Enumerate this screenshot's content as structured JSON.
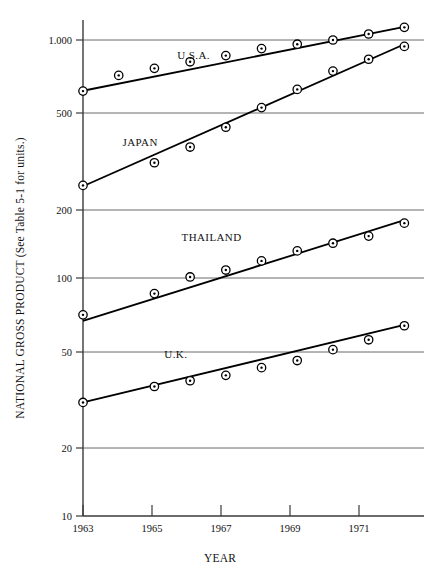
{
  "chart_data": {
    "type": "line",
    "title": "",
    "xlabel": "YEAR",
    "ylabel": "NATIONAL GROSS PRODUCT (See Table 5-1 for units.)",
    "yscale": "log",
    "ylim": [
      10,
      1300
    ],
    "xlim": [
      1963,
      1972
    ],
    "grid": true,
    "legend_position": "inline-labels",
    "y_tick_labels": [
      "1.000",
      "500",
      "200",
      "100",
      "50",
      "20",
      "10"
    ],
    "y_tick_values": [
      1000,
      500,
      200,
      100,
      50,
      20,
      10
    ],
    "x_tick_labels": [
      "1963",
      "1965",
      "1967",
      "1969",
      "1971"
    ],
    "x_tick_values": [
      1963,
      1965,
      1967,
      1969,
      1971
    ],
    "x": [
      1963,
      1964,
      1965,
      1966,
      1967,
      1968,
      1969,
      1970,
      1971,
      1972
    ],
    "series": [
      {
        "name": "U.S.A.",
        "label": "U.S.A.",
        "label_x": 1966.1,
        "label_y": 830,
        "values": [
          610,
          710,
          760,
          810,
          860,
          920,
          960,
          1000,
          1060,
          1130
        ],
        "marker": "circle-dot",
        "trend_start": 612,
        "trend_end": 1135
      },
      {
        "name": "JAPAN",
        "label": "JAPAN",
        "label_x": 1964.6,
        "label_y": 360,
        "values": [
          245,
          245,
          305,
          355,
          430,
          520,
          620,
          740,
          830,
          940
        ],
        "marker": "circle-dot",
        "trend_start": 243,
        "trend_end": 960
      },
      {
        "name": "THAILAND",
        "label": "THAILAND",
        "label_x": 1966.6,
        "label_y": 143,
        "values": [
          70,
          70,
          86,
          101,
          108,
          118,
          130,
          140,
          150,
          170
        ],
        "marker": "circle-dot",
        "trend_start": 66,
        "trend_end": 175
      },
      {
        "name": "U.K.",
        "label": "U.K.",
        "label_x": 1965.6,
        "label_y": 46,
        "values": [
          30,
          30,
          35,
          37,
          39,
          42,
          45,
          50,
          55,
          63
        ],
        "marker": "circle-dot",
        "trend_start": 30,
        "trend_end": 63.5
      }
    ]
  }
}
